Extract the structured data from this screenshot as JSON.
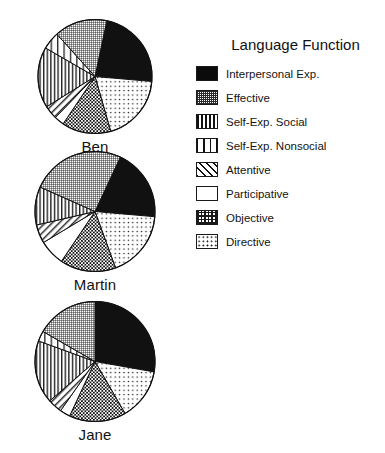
{
  "legend": {
    "title": "Language Function",
    "items": [
      {
        "label": "Interpersonal Exp.",
        "pattern": "solid",
        "swatch_class": "sw-solid"
      },
      {
        "label": "Effective",
        "pattern": "dense-grid",
        "swatch_class": "sw-dense-grid"
      },
      {
        "label": "Self-Exp. Social",
        "pattern": "vline-dense",
        "swatch_class": "sw-vline-dense"
      },
      {
        "label": "Self-Exp. Nonsocial",
        "pattern": "vline-sparse",
        "swatch_class": "sw-vline-sparse"
      },
      {
        "label": "Attentive",
        "pattern": "diagonal",
        "swatch_class": "sw-diag"
      },
      {
        "label": "Participative",
        "pattern": "empty",
        "swatch_class": "sw-empty"
      },
      {
        "label": "Objective",
        "pattern": "checker",
        "swatch_class": "sw-checker"
      },
      {
        "label": "Directive",
        "pattern": "dots",
        "swatch_class": "sw-dots"
      }
    ]
  },
  "pies": [
    {
      "name": "Ben",
      "caption": "Ben",
      "radius": 57,
      "start_angle": 12
    },
    {
      "name": "Martin",
      "caption": "Martin",
      "radius": 60,
      "start_angle": 25
    },
    {
      "name": "Jane",
      "caption": "Jane",
      "radius": 60,
      "start_angle": 0
    }
  ],
  "footer": {
    "caption": ""
  },
  "colors": {
    "ink": "#111111",
    "outline": "#1a1a1a",
    "background": "#ffffff"
  },
  "chart_data": {
    "type": "pie",
    "title": "Language Function",
    "xlabel": "",
    "ylabel": "",
    "legend_position": "right",
    "grid": false,
    "units": "percent of utterances",
    "categories": [
      "Interpersonal Exp.",
      "Effective",
      "Self-Exp. Social",
      "Self-Exp. Nonsocial",
      "Attentive",
      "Participative",
      "Objective",
      "Directive"
    ],
    "series": [
      {
        "name": "Ben",
        "values": [
          23,
          15,
          17,
          5,
          4,
          3,
          14,
          19
        ],
        "slices": [
          {
            "category": "Interpersonal Exp.",
            "value": 23,
            "start_deg": 12,
            "end_deg": 95
          },
          {
            "category": "Directive",
            "value": 19,
            "start_deg": 95,
            "end_deg": 164
          },
          {
            "category": "Objective",
            "value": 14,
            "start_deg": 164,
            "end_deg": 214
          },
          {
            "category": "Participative",
            "value": 3,
            "start_deg": 214,
            "end_deg": 224
          },
          {
            "category": "Attentive",
            "value": 4,
            "start_deg": 224,
            "end_deg": 238
          },
          {
            "category": "Self-Exp. Social",
            "value": 17,
            "start_deg": 238,
            "end_deg": 300
          },
          {
            "category": "Self-Exp. Nonsocial",
            "value": 5,
            "start_deg": 300,
            "end_deg": 318
          },
          {
            "category": "Effective",
            "value": 15,
            "start_deg": 318,
            "end_deg": 372
          }
        ]
      },
      {
        "name": "Martin",
        "values": [
          19,
          25,
          10,
          0,
          5,
          7,
          15,
          18
        ],
        "slices": [
          {
            "category": "Interpersonal Exp.",
            "value": 19,
            "start_deg": 25,
            "end_deg": 95
          },
          {
            "category": "Directive",
            "value": 18,
            "start_deg": 95,
            "end_deg": 160
          },
          {
            "category": "Objective",
            "value": 15,
            "start_deg": 160,
            "end_deg": 214
          },
          {
            "category": "Participative",
            "value": 7,
            "start_deg": 214,
            "end_deg": 239
          },
          {
            "category": "Attentive",
            "value": 5,
            "start_deg": 239,
            "end_deg": 257
          },
          {
            "category": "Self-Exp. Social",
            "value": 10,
            "start_deg": 257,
            "end_deg": 294
          },
          {
            "category": "Effective",
            "value": 25,
            "start_deg": 294,
            "end_deg": 385
          }
        ]
      },
      {
        "name": "Jane",
        "values": [
          28,
          17,
          17,
          3,
          4,
          3,
          15,
          14
        ],
        "slices": [
          {
            "category": "Interpersonal Exp.",
            "value": 28,
            "start_deg": 0,
            "end_deg": 100
          },
          {
            "category": "Directive",
            "value": 14,
            "start_deg": 100,
            "end_deg": 150
          },
          {
            "category": "Objective",
            "value": 15,
            "start_deg": 150,
            "end_deg": 205
          },
          {
            "category": "Participative",
            "value": 3,
            "start_deg": 205,
            "end_deg": 215
          },
          {
            "category": "Attentive",
            "value": 4,
            "start_deg": 215,
            "end_deg": 229
          },
          {
            "category": "Self-Exp. Social",
            "value": 17,
            "start_deg": 229,
            "end_deg": 290
          },
          {
            "category": "Self-Exp. Nonsocial",
            "value": 3,
            "start_deg": 290,
            "end_deg": 300
          },
          {
            "category": "Effective",
            "value": 17,
            "start_deg": 300,
            "end_deg": 360
          }
        ]
      }
    ]
  }
}
